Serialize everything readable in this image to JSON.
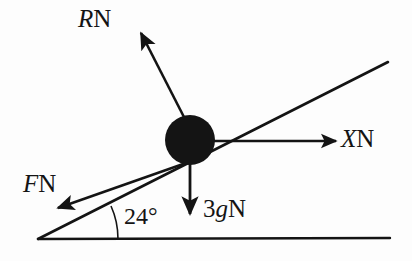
{
  "figure": {
    "kind": "free-body-diagram",
    "background_color": "#fdfdfd",
    "ink_color": "#141414",
    "width": 412,
    "height": 261
  },
  "incline": {
    "angle_label": "24°",
    "angle_value": 24,
    "angle_unit": "degrees"
  },
  "particle": {
    "shape": "filled-circle",
    "color": "#141414"
  },
  "forces": [
    {
      "id": "normal",
      "symbol": "R",
      "unit": "N",
      "label": "RN",
      "direction": "up-left perpendicular to incline"
    },
    {
      "id": "applied",
      "symbol": "X",
      "unit": "N",
      "label": "XN",
      "direction": "horizontal right"
    },
    {
      "id": "friction",
      "symbol": "F",
      "unit": "N",
      "label": "FN",
      "direction": "down-left along incline"
    },
    {
      "id": "weight",
      "symbol": "3g",
      "unit": "N",
      "label": "3gN",
      "coefficient": "3",
      "gravity_symbol": "g",
      "direction": "vertically down"
    }
  ],
  "labels": {
    "normal_symbol": "R",
    "normal_unit": "N",
    "applied_symbol": "X",
    "applied_unit": "N",
    "friction_symbol": "F",
    "friction_unit": "N",
    "weight_coefficient": "3",
    "weight_gravity": "g",
    "weight_unit": "N",
    "angle": "24°"
  }
}
